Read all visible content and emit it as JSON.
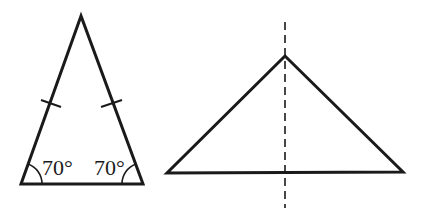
{
  "figure": {
    "left_triangle": {
      "type": "isosceles",
      "vertices": {
        "apex": [
          81,
          16
        ],
        "bottom_left": [
          21,
          184
        ],
        "bottom_right": [
          143,
          184
        ]
      },
      "base_angle_labels": [
        "70°",
        "70°"
      ],
      "equal_side_tick_marks": 2
    },
    "right_triangle": {
      "vertices": {
        "apex": [
          285,
          56
        ],
        "bottom_left": [
          167,
          173
        ],
        "bottom_right": [
          403,
          172
        ]
      },
      "symmetry_line": {
        "style": "dashed",
        "x": 285,
        "y_start": 22,
        "y_end": 208
      }
    }
  },
  "labels": {
    "left_angle": "70°",
    "right_angle": "70°"
  },
  "colors": {
    "line": "#1a1a1a",
    "background": "#ffffff"
  }
}
